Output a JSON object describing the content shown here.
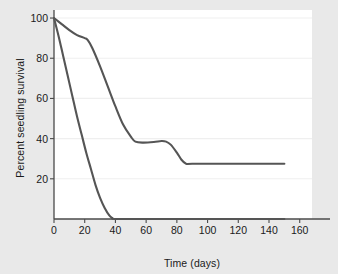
{
  "chart_data": {
    "type": "line",
    "title": "",
    "xlabel": "Time (days)",
    "ylabel": "Percent seedling survival",
    "xlim": [
      0,
      168
    ],
    "ylim": [
      0,
      104
    ],
    "xticks": [
      0,
      20,
      40,
      60,
      80,
      100,
      120,
      140,
      160
    ],
    "yticks": [
      20,
      40,
      60,
      80,
      100
    ],
    "grid": true,
    "grid_axis": "y",
    "legend": "none",
    "line_color": "#555555",
    "background_color": "#e9e9e9",
    "plot_background_color": "#ffffff",
    "grid_color": "#efefef",
    "axis_color": "#4a4a4a",
    "series": [
      {
        "name": "Slow-decline curve",
        "x": [
          0,
          5,
          10,
          15,
          20,
          22,
          25,
          30,
          35,
          40,
          45,
          50,
          53,
          58,
          65,
          70,
          73,
          76,
          80,
          83,
          86,
          90,
          110,
          130,
          150
        ],
        "y": [
          100,
          97,
          94,
          91.5,
          90,
          89,
          85,
          76,
          66,
          56,
          47,
          41,
          38.5,
          38,
          38.3,
          38.8,
          38.5,
          37,
          33,
          29.5,
          27.5,
          27.5,
          27.5,
          27.5,
          27.5
        ]
      },
      {
        "name": "Rapid-decline curve",
        "x": [
          0,
          3,
          6,
          9,
          12,
          15,
          18,
          21,
          24,
          27,
          30,
          33,
          36,
          38,
          40,
          60,
          80,
          100,
          120,
          140,
          150
        ],
        "y": [
          100,
          91,
          81,
          71,
          61,
          51,
          42,
          33,
          25,
          17,
          10.5,
          5.5,
          1.8,
          0.5,
          0,
          0,
          0,
          0,
          0,
          0,
          0
        ]
      }
    ],
    "xtick_labels": [
      "0",
      "20",
      "40",
      "60",
      "80",
      "100",
      "120",
      "140",
      "160"
    ],
    "ytick_labels": [
      "20",
      "40",
      "60",
      "80",
      "100"
    ]
  }
}
